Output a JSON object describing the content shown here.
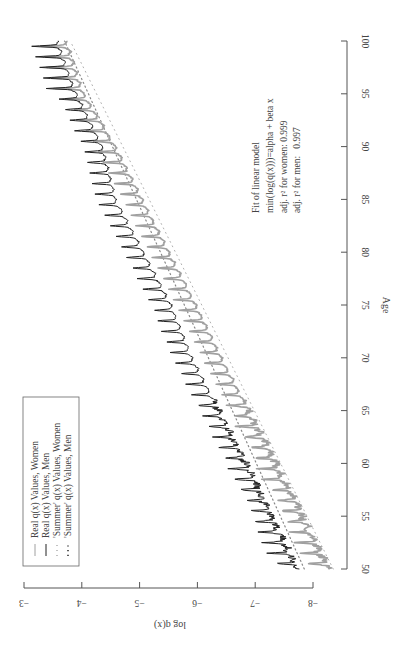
{
  "chart_data": {
    "type": "line",
    "orientation_note": "rotated 90 degrees (page landscape figure)",
    "title": "",
    "xlabel": "Age",
    "ylabel": "log q(x)",
    "xlim": [
      50,
      100
    ],
    "ylim": [
      -8,
      -3
    ],
    "x_ticks": [
      50,
      55,
      60,
      65,
      70,
      75,
      80,
      85,
      90,
      95,
      100
    ],
    "x_tick_labels": [
      "50",
      "55",
      "60",
      "65",
      "70",
      "75",
      "80",
      "85",
      "90",
      "95",
      "100"
    ],
    "y_ticks": [
      -3,
      -4,
      -5,
      -6,
      -7,
      -8
    ],
    "y_tick_labels": [
      "−3",
      "−4",
      "−5",
      "−6",
      "−7",
      "−8"
    ],
    "grid": false,
    "legend_position": "top-left",
    "series": [
      {
        "name": "Real q(x) Values, Women",
        "style": "solid",
        "color": "#a0a0a0",
        "trough_points": {
          "x": [
            50,
            60,
            70,
            75,
            85,
            90,
            95,
            100
          ],
          "y": [
            -8.29,
            -7.38,
            -6.43,
            -5.99,
            -5.06,
            -4.6,
            -4.05,
            -3.75
          ]
        },
        "periodic_spike_amplitude": 0.3,
        "spike_period_years": 1
      },
      {
        "name": "Real q(x) Values, Men",
        "style": "solid",
        "color": "#222222",
        "trough_points": {
          "x": [
            50,
            60,
            70,
            75,
            85,
            90,
            95,
            100
          ],
          "y": [
            -7.74,
            -6.86,
            -5.92,
            -5.56,
            -4.6,
            -4.37,
            -3.92,
            -3.6
          ]
        },
        "periodic_spike_amplitude": 0.3,
        "spike_period_years": 1
      },
      {
        "name": "'Summer' q(x) Values, Women",
        "style": "dotted-sparse",
        "color": "#b0b0b0",
        "fit": {
          "x": [
            50,
            100
          ],
          "y": [
            -8.35,
            -3.8
          ]
        }
      },
      {
        "name": "'Summer' q(x) Values, Men",
        "style": "dotted",
        "color": "#888888",
        "fit": {
          "x": [
            50,
            100
          ],
          "y": [
            -7.85,
            -3.7
          ]
        }
      }
    ],
    "annotations": [
      "Fit of linear model",
      "min(log(q(x)))=alpha + beta x",
      "adj. r² for women: 0.999",
      "adj. r² for men:   0.997"
    ]
  }
}
